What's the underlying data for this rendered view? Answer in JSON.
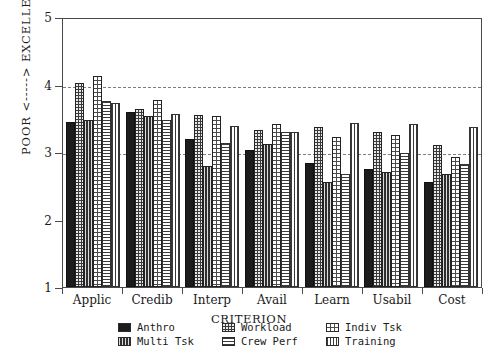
{
  "chart_data": {
    "type": "bar",
    "title": "",
    "xlabel": "CRITERION",
    "ylabel": "POOR <-----> EXCELLENT",
    "ylim": [
      1,
      5
    ],
    "yticks": [
      1,
      2,
      3,
      4,
      5
    ],
    "ytick_labels": [
      "1",
      "2",
      "3",
      "4",
      "5"
    ],
    "grid": true,
    "gridlines": [
      3,
      4
    ],
    "legend_position": "below",
    "categories": [
      "Applic",
      "Credib",
      "Interp",
      "Avail",
      "Learn",
      "Usabil",
      "Cost"
    ],
    "series": [
      {
        "name": "Anthro",
        "pattern": "solid-black",
        "values": [
          3.45,
          3.6,
          3.2,
          3.03,
          2.83,
          2.75,
          2.55
        ]
      },
      {
        "name": "Workload",
        "pattern": "dark-speckle",
        "values": [
          4.02,
          3.63,
          3.55,
          3.33,
          3.37,
          3.3,
          3.1
        ]
      },
      {
        "name": "Multi Tsk",
        "pattern": "fine-checker",
        "values": [
          3.47,
          3.53,
          2.8,
          3.12,
          2.55,
          2.7,
          2.68
        ]
      },
      {
        "name": "Indiv Tsk",
        "pattern": "dotted-grid",
        "values": [
          4.12,
          3.77,
          3.53,
          3.42,
          3.22,
          3.25,
          2.93
        ]
      },
      {
        "name": "Crew Perf",
        "pattern": "horizontal-lines",
        "values": [
          3.75,
          3.47,
          3.13,
          3.3,
          2.67,
          2.98,
          2.82
        ]
      },
      {
        "name": "Training",
        "pattern": "vertical-lines",
        "values": [
          3.73,
          3.57,
          3.38,
          3.3,
          3.43,
          3.42,
          3.37
        ]
      }
    ]
  },
  "axes": {
    "y_title": "POOR <-----> EXCELLENT",
    "x_title": "CRITERION"
  },
  "legend": {
    "items": [
      {
        "label": "Anthro",
        "swatch": "solid-black"
      },
      {
        "label": "Workload",
        "swatch": "dark-speckle"
      },
      {
        "label": "Indiv Tsk",
        "swatch": "dotted-grid"
      },
      {
        "label": "Multi Tsk",
        "swatch": "fine-checker"
      },
      {
        "label": "Crew Perf",
        "swatch": "horizontal-lines"
      },
      {
        "label": "Training",
        "swatch": "vertical-lines"
      }
    ]
  },
  "caption": {
    "text": ""
  },
  "colors": {
    "axis": "#4a4a4a",
    "grid": "#7d7d7d",
    "ink": "#1a1a1a",
    "background": "#ffffff"
  }
}
